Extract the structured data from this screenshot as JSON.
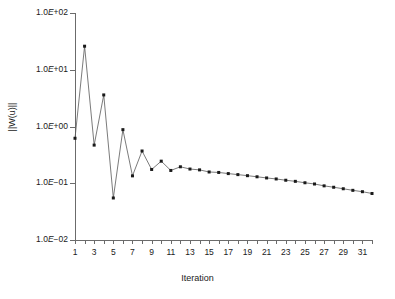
{
  "chart_data": {
    "type": "line",
    "title": "",
    "subtitle": "",
    "xlabel": "Iteration",
    "ylabel": "||W(u)||",
    "xlim": [
      1,
      32
    ],
    "ylim": [
      0.01,
      100
    ],
    "yscale": "log",
    "grid": false,
    "legend": null,
    "x_tick_labels": [
      "1",
      "3",
      "5",
      "7",
      "9",
      "11",
      "13",
      "15",
      "17",
      "19",
      "21",
      "23",
      "25",
      "27",
      "29",
      "31"
    ],
    "x_tick_values": [
      1,
      3,
      5,
      7,
      9,
      11,
      13,
      15,
      17,
      19,
      21,
      23,
      25,
      27,
      29,
      31
    ],
    "y_tick_labels": [
      "1.0E+02",
      "1.0E+01",
      "1.0E+00",
      "1.0E-01",
      "1.0E-02"
    ],
    "y_tick_values": [
      100,
      10,
      1,
      0.1,
      0.01
    ],
    "marker": "filled-square",
    "line_color": "#595959",
    "marker_color": "#1a1a1a",
    "series": [
      {
        "name": "||W(u)||",
        "x": [
          1,
          2,
          3,
          4,
          5,
          6,
          7,
          8,
          9,
          10,
          11,
          12,
          13,
          14,
          15,
          16,
          17,
          18,
          19,
          20,
          21,
          22,
          23,
          24,
          25,
          26,
          27,
          28,
          29,
          30,
          31,
          32
        ],
        "values": [
          0.62,
          26.0,
          0.47,
          3.6,
          0.055,
          0.88,
          0.135,
          0.37,
          0.175,
          0.245,
          0.168,
          0.195,
          0.178,
          0.172,
          0.158,
          0.155,
          0.148,
          0.142,
          0.136,
          0.13,
          0.124,
          0.119,
          0.113,
          0.108,
          0.102,
          0.097,
          0.09,
          0.085,
          0.08,
          0.075,
          0.071,
          0.066
        ]
      }
    ]
  },
  "axes": {
    "y_title": "||W(u)||",
    "x_title": "Iteration",
    "y_labels": [
      {
        "text_base": "1.0",
        "text_e": "E",
        "text_exp": "+02"
      },
      {
        "text_base": "1.0",
        "text_e": "E",
        "text_exp": "+01"
      },
      {
        "text_base": "1.0",
        "text_e": "E",
        "text_exp": "+00"
      },
      {
        "text_base": "1.0",
        "text_e": "E",
        "text_exp": "−01"
      },
      {
        "text_base": "1.0",
        "text_e": "E",
        "text_exp": "−02"
      }
    ],
    "y_labels_full": [
      "1.0E+02",
      "1.0E+01",
      "1.0E+00",
      "1.0E−01",
      "1.0E−02"
    ]
  },
  "colors": {
    "background": "#ffffff",
    "axis": "#6b6b6b",
    "line": "#595959",
    "marker": "#1a1a1a",
    "text": "#1a1a1a"
  }
}
